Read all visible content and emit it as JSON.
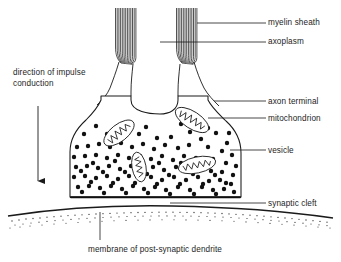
{
  "diagram": {
    "background_color": "#ffffff",
    "ink_color": "#1a1a1a",
    "labels": {
      "myelin_sheath": "myelin sheath",
      "axoplasm": "axoplasm",
      "axon_terminal": "axon terminal",
      "mitochondrion": "mitochondrion",
      "vesicle": "vesicle",
      "synaptic_cleft": "synaptic cleft",
      "membrane_post_synaptic_dendrite": "membrane of post-synaptic dendrite",
      "direction_of_impulse_conduction": "direction of impulse conduction"
    },
    "structures": {
      "axon_bundles": 2,
      "mitochondria_count": 4,
      "vesicle_count": 118,
      "arrow_direction": "down"
    }
  }
}
